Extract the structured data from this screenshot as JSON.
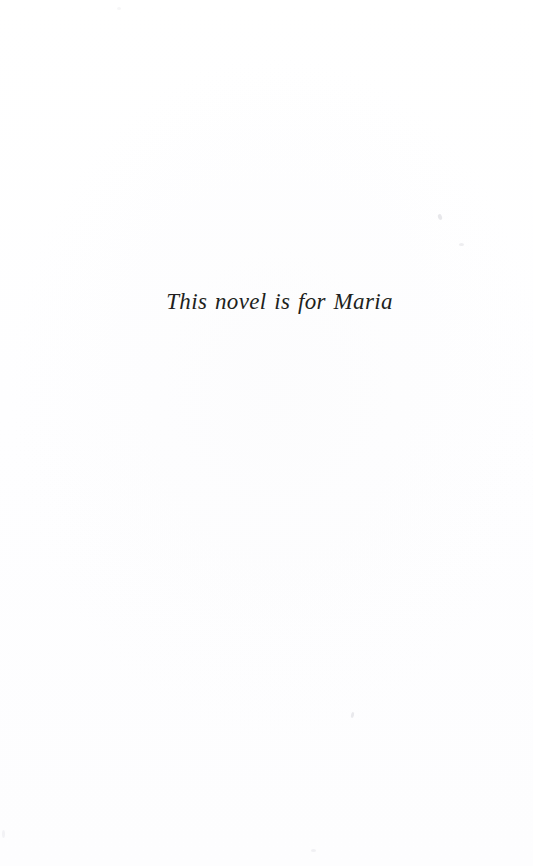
{
  "page": {
    "kind": "book-dedication-page",
    "width_px": 533,
    "height_px": 866,
    "background_color": "#ffffff",
    "text_color": "#211f20"
  },
  "dedication": {
    "text": "This novel is for Maria",
    "style": "italic-serif",
    "alignment": "center",
    "font_size_px": 23
  },
  "artifacts": {
    "specks": [
      {
        "name": "speck-upper-right-a"
      },
      {
        "name": "speck-upper-right-b"
      },
      {
        "name": "speck-lower-center"
      },
      {
        "name": "speck-bottom-center"
      },
      {
        "name": "speck-top-left"
      },
      {
        "name": "speck-bottom-left-edge"
      }
    ]
  }
}
